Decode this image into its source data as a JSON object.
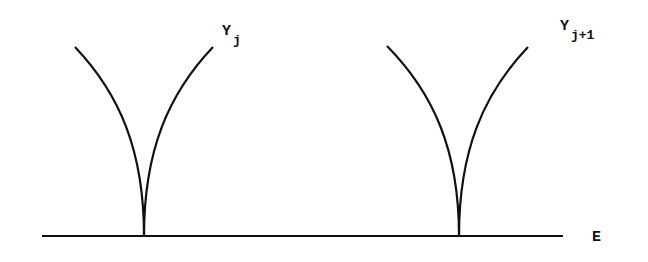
{
  "diagram": {
    "stroke_color": "#111111",
    "background": "#ffffff",
    "baseline": {
      "label": "E",
      "x1": 42,
      "x2": 563,
      "y": 236
    },
    "cusps": [
      {
        "id": "cusp-j",
        "label_main": "Y",
        "label_sub": "j",
        "tip": [
          144,
          236
        ],
        "left_top": [
          75,
          47
        ],
        "right_top": [
          213,
          47
        ]
      },
      {
        "id": "cusp-j-plus-1",
        "label_main": "Y",
        "label_sub": "j+1",
        "tip": [
          459,
          236
        ],
        "left_top": [
          387,
          46
        ],
        "right_top": [
          528,
          47
        ]
      }
    ]
  }
}
